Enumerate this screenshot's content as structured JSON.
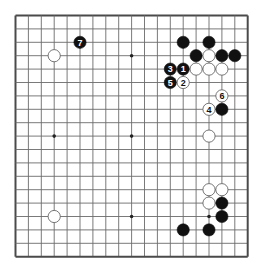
{
  "board": {
    "size": 19,
    "origin_x": 15.5,
    "origin_y": 15.5,
    "spacing_x": 12.9,
    "spacing_y": 13.4,
    "line_color": "#6b6b6b",
    "border_color": "#4a4a4a",
    "background": "#ffffff",
    "hoshi": [
      [
        3,
        3
      ],
      [
        9,
        3
      ],
      [
        15,
        3
      ],
      [
        3,
        9
      ],
      [
        9,
        9
      ],
      [
        15,
        9
      ],
      [
        3,
        15
      ],
      [
        9,
        15
      ],
      [
        15,
        15
      ]
    ]
  },
  "stones": [
    {
      "color": "black",
      "col": 5,
      "row": 2,
      "label": "7"
    },
    {
      "color": "white",
      "col": 3,
      "row": 3,
      "label": ""
    },
    {
      "color": "black",
      "col": 13,
      "row": 2,
      "label": ""
    },
    {
      "color": "black",
      "col": 15,
      "row": 2,
      "label": ""
    },
    {
      "color": "black",
      "col": 14,
      "row": 3,
      "label": ""
    },
    {
      "color": "white",
      "col": 15,
      "row": 3,
      "label": ""
    },
    {
      "color": "black",
      "col": 16,
      "row": 3,
      "label": ""
    },
    {
      "color": "black",
      "col": 17,
      "row": 3,
      "label": ""
    },
    {
      "color": "black",
      "col": 12,
      "row": 4,
      "label": "3"
    },
    {
      "color": "black",
      "col": 13,
      "row": 4,
      "label": "1"
    },
    {
      "color": "white",
      "col": 14,
      "row": 4,
      "label": ""
    },
    {
      "color": "white",
      "col": 15,
      "row": 4,
      "label": ""
    },
    {
      "color": "white",
      "col": 16,
      "row": 4,
      "label": ""
    },
    {
      "color": "black",
      "col": 12,
      "row": 5,
      "label": "5"
    },
    {
      "color": "white",
      "col": 13,
      "row": 5,
      "label": "2"
    },
    {
      "color": "white",
      "col": 16,
      "row": 6,
      "label": "6"
    },
    {
      "color": "white",
      "col": 15,
      "row": 7,
      "label": "4"
    },
    {
      "color": "black",
      "col": 16,
      "row": 7,
      "label": ""
    },
    {
      "color": "white",
      "col": 15,
      "row": 9,
      "label": ""
    },
    {
      "color": "white",
      "col": 15,
      "row": 13,
      "label": ""
    },
    {
      "color": "white",
      "col": 16,
      "row": 13,
      "label": ""
    },
    {
      "color": "white",
      "col": 15,
      "row": 14,
      "label": ""
    },
    {
      "color": "black",
      "col": 16,
      "row": 14,
      "label": ""
    },
    {
      "color": "black",
      "col": 16,
      "row": 15,
      "label": ""
    },
    {
      "color": "black",
      "col": 13,
      "row": 16,
      "label": ""
    },
    {
      "color": "black",
      "col": 15,
      "row": 16,
      "label": ""
    },
    {
      "color": "white",
      "col": 3,
      "row": 15,
      "label": ""
    }
  ]
}
